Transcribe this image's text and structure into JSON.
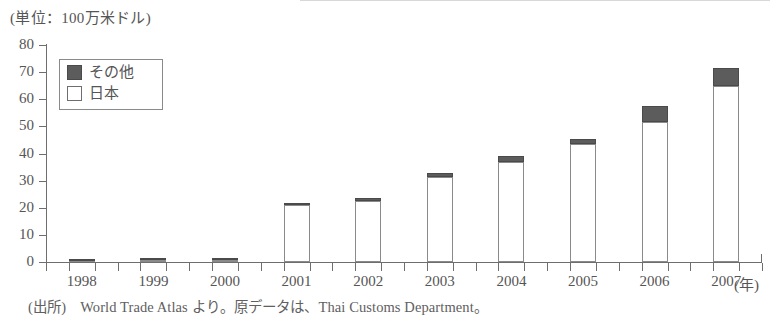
{
  "unit_label": "(単位：100万米ドル)",
  "source_note": "(出所)　World Trade Atlas より。原データは、Thai Customs Department。",
  "year_axis_label": "(年)",
  "legend": {
    "other_label": "その他",
    "japan_label": "日本"
  },
  "colors": {
    "other": "#5c5c5c",
    "japan": "#ffffff",
    "axis": "#6e6e6e",
    "bar_outline": "#8a8a8a",
    "text": "#555555"
  },
  "chart_data": {
    "type": "bar",
    "stacked": true,
    "title": "",
    "subtitle": "",
    "xlabel": "(年)",
    "ylabel": "(単位：100万米ドル)",
    "ylim": [
      0,
      80
    ],
    "yticks": [
      0,
      10,
      20,
      30,
      40,
      50,
      60,
      70,
      80
    ],
    "ytick_labels": [
      "0",
      "10",
      "20",
      "30",
      "40",
      "50",
      "60",
      "70",
      "80"
    ],
    "grid": false,
    "legend_position": "upper-left",
    "categories": [
      "1998",
      "1999",
      "2000",
      "2001",
      "2002",
      "2003",
      "2004",
      "2005",
      "2006",
      "2007"
    ],
    "series": [
      {
        "name": "日本",
        "color": "#ffffff",
        "values": [
          0.5,
          0.6,
          0.7,
          21.0,
          22.5,
          31.5,
          37.0,
          43.5,
          51.5,
          65.0
        ]
      },
      {
        "name": "その他",
        "color": "#5c5c5c",
        "values": [
          0.1,
          0.1,
          0.1,
          0.2,
          1.0,
          1.5,
          2.0,
          2.0,
          6.0,
          6.5
        ]
      }
    ],
    "totals": [
      0.6,
      0.7,
      0.8,
      21.2,
      23.5,
      33.0,
      39.0,
      45.5,
      57.5,
      71.5
    ]
  }
}
